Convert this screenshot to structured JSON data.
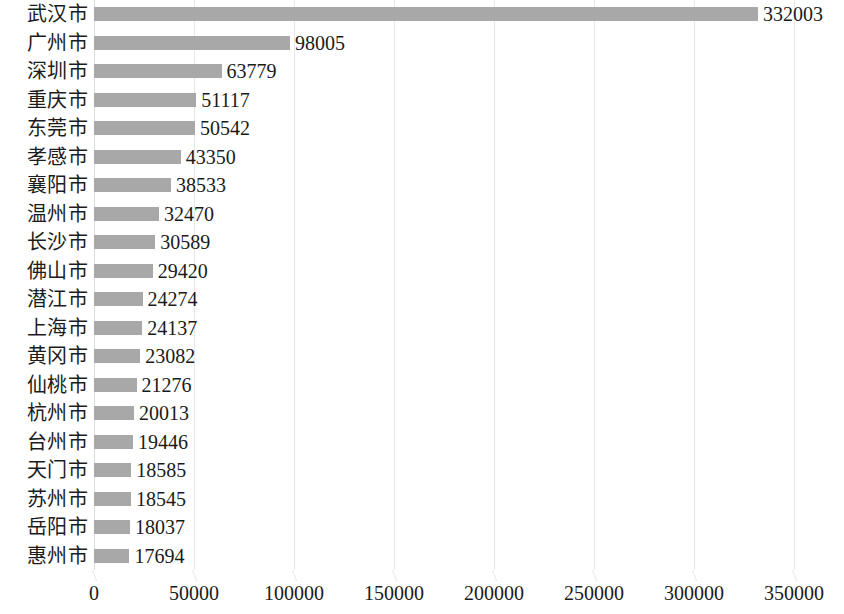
{
  "chart_data": {
    "type": "bar",
    "orientation": "horizontal",
    "title": "",
    "subtitle": "",
    "xlabel": "",
    "ylabel": "",
    "xlim": [
      0,
      350000
    ],
    "grid": true,
    "legend": false,
    "legend_position": "none",
    "bar_color": "#a8a8a8",
    "gridline_color": "#e8e8e8",
    "text_color": "#1a1a1a",
    "xticks": [
      0,
      50000,
      100000,
      150000,
      200000,
      250000,
      300000,
      350000
    ],
    "xtick_labels": [
      "0",
      "50000",
      "100000",
      "150000",
      "200000",
      "250000",
      "300000",
      "350000"
    ],
    "categories": [
      "武汉市",
      "广州市",
      "深圳市",
      "重庆市",
      "东莞市",
      "孝感市",
      "襄阳市",
      "温州市",
      "长沙市",
      "佛山市",
      "潜江市",
      "上海市",
      "黄冈市",
      "仙桃市",
      "杭州市",
      "台州市",
      "天门市",
      "苏州市",
      "岳阳市",
      "惠州市"
    ],
    "values": [
      332003,
      98005,
      63779,
      51117,
      50542,
      43350,
      38533,
      32470,
      30589,
      29420,
      24274,
      24137,
      23082,
      21276,
      20013,
      19446,
      18585,
      18545,
      18037,
      17694
    ],
    "value_labels": [
      "332003",
      "98005",
      "63779",
      "51117",
      "50542",
      "43350",
      "38533",
      "32470",
      "30589",
      "29420",
      "24274",
      "24137",
      "23082",
      "21276",
      "20013",
      "19446",
      "18585",
      "18545",
      "18037",
      "17694"
    ]
  }
}
